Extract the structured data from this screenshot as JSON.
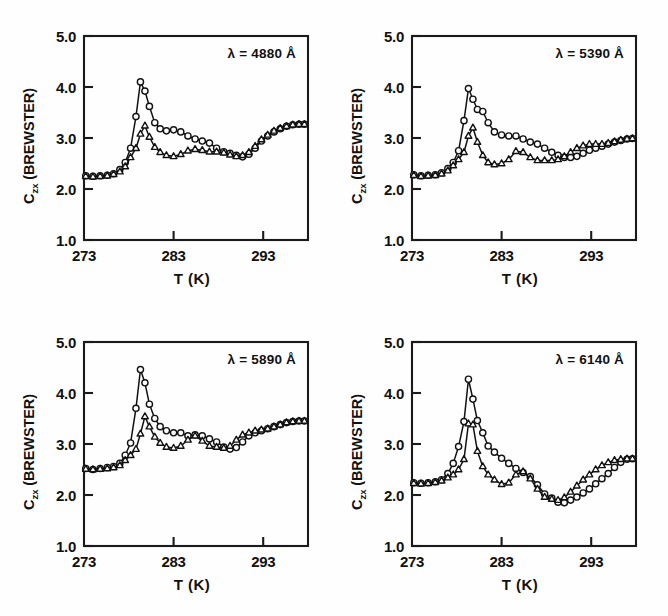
{
  "figure": {
    "background": "#fefefe",
    "ink_color": "#111111",
    "panel_count": 4
  },
  "axes_common": {
    "xlabel": "T  (K)",
    "ylabel_main": "C",
    "ylabel_sub": "zx",
    "ylabel_unit": " (BREWSTER)",
    "ylabel_full": "Czx (BREWSTER)",
    "xticks": [
      273,
      283,
      293
    ],
    "xtick_labels": [
      "273",
      "283",
      "293"
    ],
    "yticks": [
      1.0,
      2.0,
      3.0,
      4.0,
      5.0
    ],
    "ytick_labels": [
      "1.0",
      "2.0",
      "3.0",
      "4.0",
      "5.0"
    ],
    "xlim": [
      273,
      298
    ],
    "ylim": [
      1.0,
      5.0
    ],
    "grid": false,
    "legend": "none"
  },
  "chart_data": [
    {
      "type": "line",
      "panel_id": "panel-4880",
      "title": "",
      "annotation": "λ = 4880 Å",
      "wavelength_angstrom": 4880,
      "xlabel": "T  (K)",
      "ylabel": "Czx (BREWSTER)",
      "xlim": [
        273,
        298
      ],
      "ylim": [
        1.0,
        5.0
      ],
      "xticks": [
        273,
        283,
        293
      ],
      "yticks": [
        1.0,
        2.0,
        3.0,
        4.0,
        5.0
      ],
      "grid": false,
      "series": [
        {
          "name": "circles",
          "marker": "circle",
          "x": [
            273.2,
            274.0,
            274.8,
            275.6,
            276.3,
            277.0,
            277.6,
            278.2,
            278.8,
            279.3,
            279.8,
            280.3,
            280.9,
            281.5,
            282.2,
            283.0,
            283.8,
            284.6,
            285.4,
            286.2,
            287.0,
            287.8,
            288.6,
            289.3,
            290.0,
            290.7,
            291.4,
            292.1,
            292.8,
            293.5,
            294.2,
            294.9,
            295.6,
            296.3,
            297.0,
            297.6
          ],
          "y": [
            2.26,
            2.25,
            2.26,
            2.27,
            2.3,
            2.38,
            2.52,
            2.8,
            3.42,
            4.1,
            3.92,
            3.62,
            3.3,
            3.18,
            3.14,
            3.16,
            3.12,
            3.04,
            2.98,
            2.94,
            2.9,
            2.8,
            2.73,
            2.7,
            2.66,
            2.63,
            2.68,
            2.8,
            2.94,
            3.04,
            3.12,
            3.18,
            3.23,
            3.26,
            3.27,
            3.27
          ]
        },
        {
          "name": "triangles",
          "marker": "triangle",
          "x": [
            273.2,
            274.0,
            274.8,
            275.6,
            276.3,
            277.0,
            277.6,
            278.2,
            278.8,
            279.3,
            279.8,
            280.3,
            280.9,
            281.5,
            282.2,
            283.0,
            283.8,
            284.6,
            285.4,
            286.2,
            287.0,
            287.8,
            288.6,
            289.3,
            290.0,
            290.7,
            291.4,
            292.1,
            292.8,
            293.5,
            294.2,
            294.9,
            295.6,
            296.3,
            297.0,
            297.6
          ],
          "y": [
            2.25,
            2.24,
            2.25,
            2.26,
            2.29,
            2.34,
            2.44,
            2.62,
            2.8,
            3.08,
            3.24,
            3.02,
            2.82,
            2.72,
            2.66,
            2.64,
            2.68,
            2.75,
            2.78,
            2.76,
            2.73,
            2.73,
            2.71,
            2.67,
            2.64,
            2.66,
            2.72,
            2.84,
            2.97,
            3.06,
            3.14,
            3.19,
            3.23,
            3.26,
            3.27,
            3.27
          ]
        }
      ]
    },
    {
      "type": "line",
      "panel_id": "panel-5390",
      "title": "",
      "annotation": "λ = 5390 Å",
      "wavelength_angstrom": 5390,
      "xlabel": "T  (K)",
      "ylabel": "Czx (BREWSTER)",
      "xlim": [
        273,
        298
      ],
      "ylim": [
        1.0,
        5.0
      ],
      "xticks": [
        273,
        283,
        293
      ],
      "yticks": [
        1.0,
        2.0,
        3.0,
        4.0,
        5.0
      ],
      "grid": false,
      "series": [
        {
          "name": "circles",
          "marker": "circle",
          "x": [
            273.2,
            274.0,
            274.8,
            275.6,
            276.3,
            277.0,
            277.6,
            278.2,
            278.8,
            279.3,
            279.8,
            280.3,
            280.9,
            281.5,
            282.2,
            283.0,
            283.8,
            284.6,
            285.4,
            286.2,
            287.0,
            287.8,
            288.6,
            289.3,
            290.0,
            290.7,
            291.4,
            292.1,
            292.8,
            293.5,
            294.2,
            294.9,
            295.6,
            296.3,
            297.0,
            297.6
          ],
          "y": [
            2.28,
            2.26,
            2.27,
            2.28,
            2.32,
            2.4,
            2.52,
            2.75,
            3.34,
            3.97,
            3.76,
            3.56,
            3.52,
            3.3,
            3.12,
            3.06,
            3.04,
            3.04,
            2.98,
            2.92,
            2.88,
            2.8,
            2.72,
            2.66,
            2.62,
            2.62,
            2.64,
            2.7,
            2.76,
            2.8,
            2.84,
            2.88,
            2.92,
            2.95,
            2.98,
            2.99
          ]
        },
        {
          "name": "triangles",
          "marker": "triangle",
          "x": [
            273.2,
            274.0,
            274.8,
            275.6,
            276.3,
            277.0,
            277.6,
            278.2,
            278.8,
            279.3,
            279.8,
            280.3,
            280.9,
            281.5,
            282.2,
            283.0,
            283.8,
            284.6,
            285.4,
            286.2,
            287.0,
            287.8,
            288.6,
            289.3,
            290.0,
            290.7,
            291.4,
            292.1,
            292.8,
            293.5,
            294.2,
            294.9,
            295.6,
            296.3,
            297.0,
            297.6
          ],
          "y": [
            2.27,
            2.25,
            2.26,
            2.27,
            2.3,
            2.36,
            2.46,
            2.58,
            2.72,
            3.04,
            3.2,
            2.92,
            2.66,
            2.52,
            2.48,
            2.5,
            2.58,
            2.74,
            2.72,
            2.62,
            2.56,
            2.56,
            2.56,
            2.58,
            2.64,
            2.72,
            2.8,
            2.85,
            2.88,
            2.88,
            2.88,
            2.9,
            2.93,
            2.96,
            2.98,
            2.99
          ]
        }
      ]
    },
    {
      "type": "line",
      "panel_id": "panel-5890",
      "title": "",
      "annotation": "λ = 5890 Å",
      "wavelength_angstrom": 5890,
      "xlabel": "T  (K)",
      "ylabel": "Czx (BREWSTER)",
      "xlim": [
        273,
        298
      ],
      "ylim": [
        1.0,
        5.0
      ],
      "xticks": [
        273,
        283,
        293
      ],
      "yticks": [
        1.0,
        2.0,
        3.0,
        4.0,
        5.0
      ],
      "grid": false,
      "series": [
        {
          "name": "circles",
          "marker": "circle",
          "x": [
            273.2,
            274.0,
            274.8,
            275.6,
            276.3,
            277.0,
            277.6,
            278.2,
            278.8,
            279.3,
            279.8,
            280.3,
            280.9,
            281.5,
            282.2,
            283.0,
            283.8,
            284.6,
            285.4,
            286.2,
            287.0,
            287.8,
            288.6,
            289.3,
            290.0,
            290.7,
            291.4,
            292.1,
            292.8,
            293.5,
            294.2,
            294.9,
            295.6,
            296.3,
            297.0,
            297.6
          ],
          "y": [
            2.52,
            2.5,
            2.52,
            2.54,
            2.56,
            2.62,
            2.78,
            3.02,
            3.7,
            4.46,
            4.2,
            3.78,
            3.5,
            3.34,
            3.26,
            3.22,
            3.22,
            3.16,
            3.18,
            3.16,
            3.1,
            3.04,
            2.94,
            2.9,
            2.93,
            3.04,
            3.16,
            3.22,
            3.26,
            3.3,
            3.34,
            3.38,
            3.42,
            3.44,
            3.45,
            3.45
          ]
        },
        {
          "name": "triangles",
          "marker": "triangle",
          "x": [
            273.2,
            274.0,
            274.8,
            275.6,
            276.3,
            277.0,
            277.6,
            278.2,
            278.8,
            279.3,
            279.8,
            280.3,
            280.9,
            281.5,
            282.2,
            283.0,
            283.8,
            284.6,
            285.4,
            286.2,
            287.0,
            287.8,
            288.6,
            289.3,
            290.0,
            290.7,
            291.4,
            292.1,
            292.8,
            293.5,
            294.2,
            294.9,
            295.6,
            296.3,
            297.0,
            297.6
          ],
          "y": [
            2.51,
            2.5,
            2.51,
            2.52,
            2.54,
            2.58,
            2.68,
            2.78,
            2.9,
            3.2,
            3.54,
            3.34,
            3.14,
            3.02,
            2.94,
            2.92,
            2.96,
            3.08,
            3.16,
            3.06,
            2.96,
            2.94,
            2.92,
            2.96,
            3.08,
            3.18,
            3.22,
            3.26,
            3.28,
            3.3,
            3.34,
            3.38,
            3.42,
            3.44,
            3.45,
            3.45
          ]
        }
      ]
    },
    {
      "type": "line",
      "panel_id": "panel-6140",
      "title": "",
      "annotation": "λ = 6140 Å",
      "wavelength_angstrom": 6140,
      "xlabel": "T  (K)",
      "ylabel": "Czx (BREWSTER)",
      "xlim": [
        273,
        298
      ],
      "ylim": [
        1.0,
        5.0
      ],
      "xticks": [
        273,
        283,
        293
      ],
      "yticks": [
        1.0,
        2.0,
        3.0,
        4.0,
        5.0
      ],
      "grid": false,
      "series": [
        {
          "name": "circles",
          "marker": "circle",
          "x": [
            273.2,
            274.0,
            274.8,
            275.6,
            276.3,
            277.0,
            277.6,
            278.2,
            278.8,
            279.3,
            279.8,
            280.3,
            280.9,
            281.5,
            282.2,
            283.0,
            283.8,
            284.6,
            285.4,
            286.2,
            287.0,
            287.8,
            288.6,
            289.3,
            290.0,
            290.7,
            291.4,
            292.1,
            292.8,
            293.5,
            294.2,
            294.9,
            295.6,
            296.3,
            297.0,
            297.6
          ],
          "y": [
            2.24,
            2.23,
            2.24,
            2.26,
            2.3,
            2.42,
            2.62,
            2.95,
            3.44,
            4.27,
            3.88,
            3.46,
            3.22,
            2.96,
            2.84,
            2.72,
            2.62,
            2.52,
            2.44,
            2.36,
            2.2,
            2.02,
            1.94,
            1.86,
            1.85,
            1.9,
            1.96,
            2.04,
            2.12,
            2.22,
            2.32,
            2.42,
            2.54,
            2.64,
            2.7,
            2.71
          ]
        },
        {
          "name": "triangles",
          "marker": "triangle",
          "x": [
            273.2,
            274.0,
            274.8,
            275.6,
            276.3,
            277.0,
            277.6,
            278.2,
            278.8,
            279.3,
            279.8,
            280.3,
            280.9,
            281.5,
            282.2,
            283.0,
            283.8,
            284.6,
            285.4,
            286.2,
            287.0,
            287.8,
            288.6,
            289.3,
            290.0,
            290.7,
            291.4,
            292.1,
            292.8,
            293.5,
            294.2,
            294.9,
            295.6,
            296.3,
            297.0,
            297.6
          ],
          "y": [
            2.23,
            2.22,
            2.23,
            2.25,
            2.28,
            2.34,
            2.4,
            2.5,
            2.7,
            3.4,
            3.38,
            2.86,
            2.56,
            2.4,
            2.3,
            2.21,
            2.24,
            2.4,
            2.46,
            2.32,
            2.12,
            1.96,
            1.92,
            1.9,
            1.95,
            2.06,
            2.18,
            2.3,
            2.4,
            2.5,
            2.58,
            2.64,
            2.68,
            2.7,
            2.71,
            2.71
          ]
        }
      ]
    }
  ]
}
